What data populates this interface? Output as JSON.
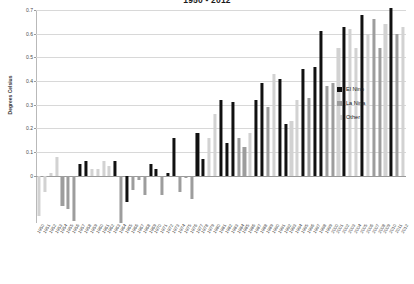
{
  "chart_data": {
    "type": "bar",
    "title": "1950 - 2012",
    "xlabel": "",
    "ylabel": "Degrees Celsius",
    "ylim": [
      -0.2,
      0.7
    ],
    "yticks": [
      0.7,
      0.6,
      0.5,
      0.4,
      0.3,
      0.2,
      0.1,
      0
    ],
    "ytick_labels": [
      "0.7",
      "0.6",
      "0.5",
      "0.4",
      "0.3",
      "0.2",
      "0.1",
      "0"
    ],
    "grid": true,
    "legend_position": "right",
    "legend": [
      {
        "name": "El Nino",
        "color": "#111111"
      },
      {
        "name": "La Nina",
        "color": "#9d9d9d"
      },
      {
        "name": "Other",
        "color": "#d2d2d2"
      }
    ],
    "categories": [
      "1950",
      "1951",
      "1952",
      "1953",
      "1954",
      "1955",
      "1956",
      "1957",
      "1958",
      "1959",
      "1960",
      "1961",
      "1962",
      "1963",
      "1964",
      "1965",
      "1966",
      "1967",
      "1968",
      "1969",
      "1970",
      "1971",
      "1972",
      "1973",
      "1974",
      "1975",
      "1976",
      "1977",
      "1978",
      "1979",
      "1980",
      "1981",
      "1982",
      "1983",
      "1984",
      "1985",
      "1986",
      "1987",
      "1988",
      "1989",
      "1990",
      "1991",
      "1992",
      "1993",
      "1994",
      "1995",
      "1996",
      "1997",
      "1998",
      "1999",
      "2000",
      "2001",
      "2002",
      "2003",
      "2004",
      "2005",
      "2006",
      "2007",
      "2008",
      "2009",
      "2010",
      "2011",
      "2012"
    ],
    "values": [
      -0.17,
      -0.07,
      0.01,
      0.08,
      -0.13,
      -0.14,
      -0.19,
      0.05,
      0.06,
      0.03,
      0.03,
      0.06,
      0.04,
      0.06,
      -0.2,
      -0.11,
      -0.06,
      -0.02,
      -0.08,
      0.05,
      0.03,
      -0.08,
      0.01,
      0.16,
      -0.07,
      -0.01,
      -0.1,
      0.18,
      0.07,
      0.16,
      0.26,
      0.32,
      0.14,
      0.31,
      0.16,
      0.12,
      0.18,
      0.32,
      0.39,
      0.29,
      0.43,
      0.41,
      0.22,
      0.23,
      0.32,
      0.45,
      0.33,
      0.46,
      0.61,
      0.38,
      0.39,
      0.54,
      0.63,
      0.62,
      0.54,
      0.68,
      0.6,
      0.66,
      0.54,
      0.64,
      0.71,
      0.6,
      0.63
    ],
    "point_categories": [
      "other",
      "other",
      "other",
      "other",
      "lanina",
      "lanina",
      "lanina",
      "elnino",
      "elnino",
      "other",
      "other",
      "other",
      "other",
      "elnino",
      "lanina",
      "elnino",
      "lanina",
      "lanina",
      "lanina",
      "elnino",
      "elnino",
      "lanina",
      "elnino",
      "elnino",
      "lanina",
      "lanina",
      "lanina",
      "elnino",
      "elnino",
      "other",
      "other",
      "elnino",
      "elnino",
      "elnino",
      "lanina",
      "lanina",
      "other",
      "elnino",
      "elnino",
      "lanina",
      "other",
      "elnino",
      "elnino",
      "other",
      "other",
      "elnino",
      "lanina",
      "elnino",
      "elnino",
      "lanina",
      "lanina",
      "other",
      "elnino",
      "other",
      "other",
      "elnino",
      "other",
      "lanina",
      "lanina",
      "other",
      "elnino",
      "lanina",
      "other"
    ],
    "bar_categories_legend_map": {
      "elnino": "El Nino",
      "lanina": "La Nina",
      "other": "Other"
    }
  }
}
